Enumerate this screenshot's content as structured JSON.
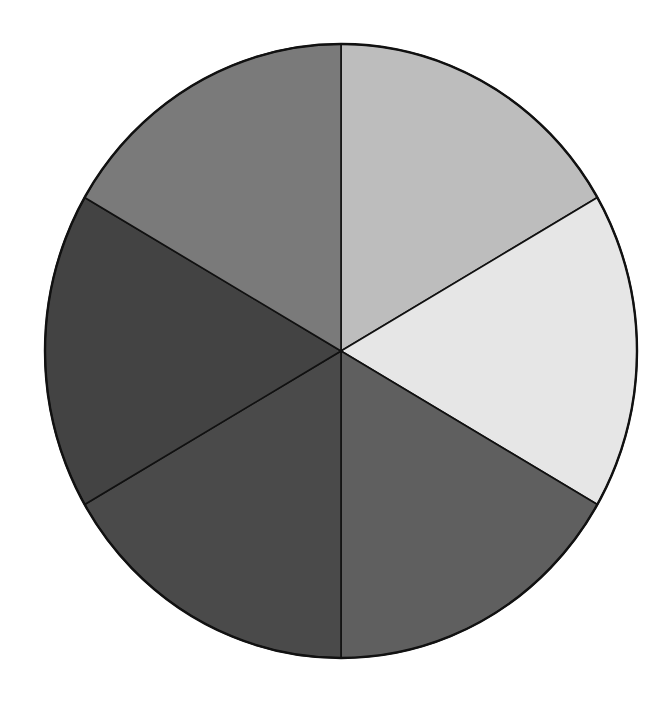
{
  "chart_data": {
    "type": "pie",
    "title": "",
    "labels": [
      "",
      "",
      "",
      "",
      "",
      ""
    ],
    "values": [
      1,
      1,
      1,
      1,
      1,
      1
    ],
    "percentages": [
      16.67,
      16.67,
      16.67,
      16.67,
      16.67,
      16.67
    ],
    "start_angle_deg": 90,
    "direction": "clockwise",
    "colors": [
      "#bdbdbd",
      "#e6e6e6",
      "#5f5f5f",
      "#4a4a4a",
      "#434343",
      "#7a7a7a"
    ],
    "slice_order_description": [
      "top-right",
      "right",
      "bottom-right",
      "bottom-left",
      "left",
      "top-left"
    ],
    "legend": null,
    "annotations": []
  },
  "geometry": {
    "cx": 341,
    "cy": 351,
    "rx": 296,
    "ry": 307
  },
  "style": {
    "stroke": "#111111",
    "background": "#ffffff"
  }
}
